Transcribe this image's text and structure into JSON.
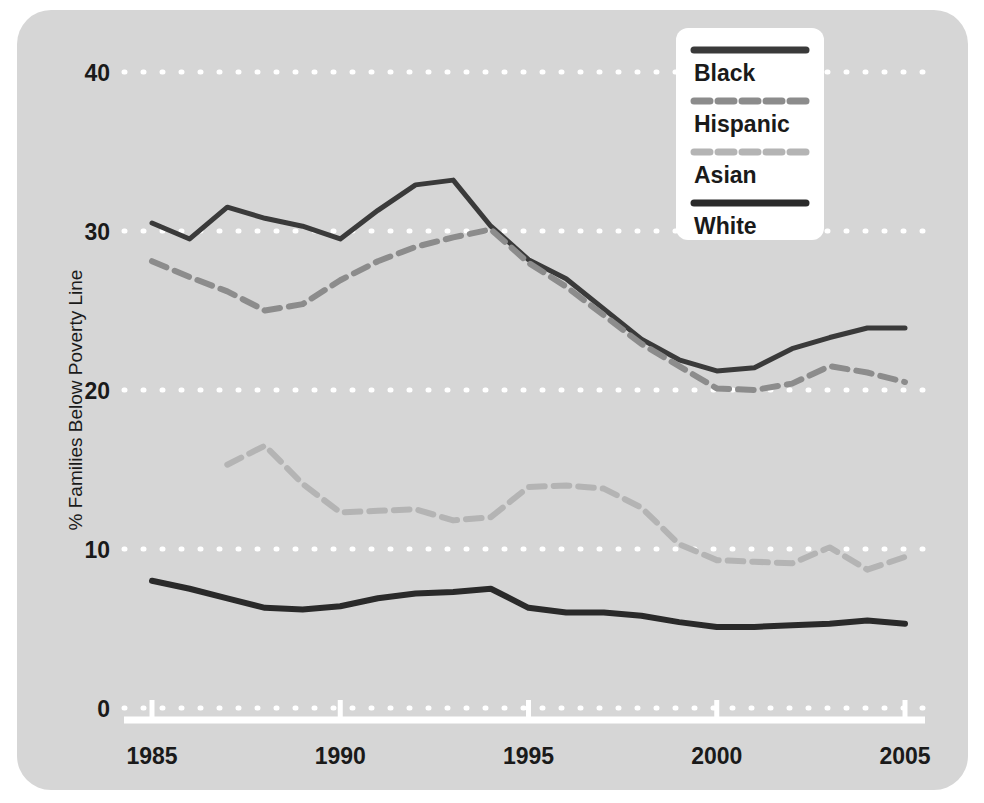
{
  "chart_data": {
    "type": "line",
    "title": "",
    "subtitle": "",
    "xlabel": "",
    "ylabel": "% Families Below Poverty Line",
    "xlim": [
      1985,
      2005
    ],
    "ylim": [
      0,
      40
    ],
    "xticks": [
      1985,
      1990,
      1995,
      2000,
      2005
    ],
    "xtick_labels": [
      "1985",
      "1990",
      "1995",
      "2000",
      "2005"
    ],
    "yticks": [
      0,
      10,
      20,
      30,
      40
    ],
    "ytick_labels": [
      "0",
      "10",
      "20",
      "30",
      "40"
    ],
    "grid": "horizontal dotted white gridlines at each y tick",
    "legend_position": "top-right",
    "background_color": "#d6d6d6",
    "gridline_color": "#ffffff",
    "axis_color": "#ffffff",
    "x": [
      1985,
      1986,
      1987,
      1988,
      1989,
      1990,
      1991,
      1992,
      1993,
      1994,
      1995,
      1996,
      1997,
      1998,
      1999,
      2000,
      2001,
      2002,
      2003,
      2004,
      2005
    ],
    "series": [
      {
        "name": "Black",
        "color": "#3a3a3a",
        "style": "solid",
        "width": 5,
        "values": [
          30.5,
          29.5,
          31.5,
          30.8,
          30.3,
          29.5,
          31.3,
          32.9,
          33.2,
          30.3,
          28.2,
          27.0,
          25.1,
          23.2,
          21.9,
          21.2,
          21.4,
          22.6,
          23.3,
          23.9,
          23.9
        ]
      },
      {
        "name": "Hispanic",
        "color": "#8c8c8c",
        "style": "dashed",
        "width": 6,
        "values": [
          28.1,
          27.1,
          26.2,
          25.0,
          25.4,
          26.9,
          28.1,
          29.0,
          29.6,
          30.1,
          28.0,
          26.5,
          24.7,
          22.9,
          21.5,
          20.1,
          20.0,
          20.4,
          21.5,
          21.1,
          20.5
        ]
      },
      {
        "name": "Asian",
        "color": "#b4b4b4",
        "style": "dashed",
        "width": 6,
        "values": [
          null,
          null,
          15.3,
          16.5,
          14.1,
          12.3,
          12.4,
          12.5,
          11.8,
          12.0,
          13.9,
          14.0,
          13.8,
          12.6,
          10.3,
          9.3,
          9.2,
          9.1,
          10.1,
          8.7,
          9.5
        ]
      },
      {
        "name": "White",
        "color": "#2a2a2a",
        "style": "solid",
        "width": 6,
        "values": [
          8.0,
          7.5,
          6.9,
          6.3,
          6.2,
          6.4,
          6.9,
          7.2,
          7.3,
          7.5,
          6.3,
          6.0,
          6.0,
          5.8,
          5.4,
          5.1,
          5.1,
          5.2,
          5.3,
          5.5,
          5.3
        ]
      }
    ]
  },
  "legend": {
    "items": [
      {
        "label": "Black",
        "color": "#3a3a3a",
        "style": "solid"
      },
      {
        "label": "Hispanic",
        "color": "#8c8c8c",
        "style": "dashed"
      },
      {
        "label": "Asian",
        "color": "#b4b4b4",
        "style": "dashed"
      },
      {
        "label": "White",
        "color": "#2a2a2a",
        "style": "solid"
      }
    ],
    "background": "#ffffff"
  }
}
